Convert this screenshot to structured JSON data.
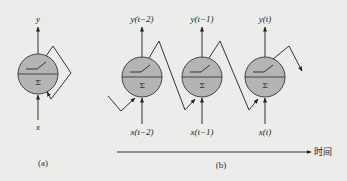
{
  "colors": {
    "background": "#ececea",
    "neuron_fill": "#b4b4b2",
    "stroke": "#333333"
  },
  "panel_a": {
    "caption": "(a)",
    "neuron": {
      "symbol": "Σ",
      "output_label": "y",
      "input_label": "x"
    }
  },
  "panel_b": {
    "caption": "(b)",
    "neurons": [
      {
        "symbol": "Σ",
        "output_label": "y(t−2)",
        "input_label": "x(t−2)"
      },
      {
        "symbol": "Σ",
        "output_label": "y(t−1)",
        "input_label": "x(t−1)"
      },
      {
        "symbol": "Σ",
        "output_label": "y(t)",
        "input_label": "x(t)"
      }
    ],
    "time_axis_label": "时间"
  }
}
